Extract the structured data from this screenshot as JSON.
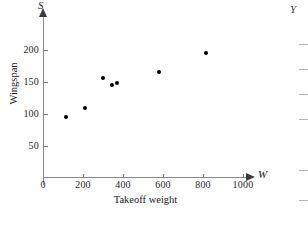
{
  "chart_data": {
    "type": "scatter",
    "title": "",
    "xlabel": "Takeoff weight",
    "ylabel": "Wingspan",
    "x_axis_variable": "W",
    "y_axis_variable": "S",
    "xlim": [
      0,
      1100
    ],
    "ylim": [
      0,
      225
    ],
    "grid": false,
    "legend": null,
    "x_ticks": [
      0,
      200,
      400,
      600,
      800,
      1000
    ],
    "y_ticks": [
      50,
      100,
      150,
      200
    ],
    "points": [
      {
        "x": 115,
        "y": 94
      },
      {
        "x": 210,
        "y": 108
      },
      {
        "x": 300,
        "y": 156
      },
      {
        "x": 345,
        "y": 145
      },
      {
        "x": 370,
        "y": 148
      },
      {
        "x": 580,
        "y": 165
      },
      {
        "x": 815,
        "y": 195
      }
    ]
  },
  "figure": {
    "x_tick_labels": [
      "0",
      "200",
      "400",
      "600",
      "800",
      "1000"
    ],
    "y_tick_labels": [
      "200",
      "150",
      "100",
      "50"
    ],
    "x_axis_variable": "W",
    "y_axis_variable": "S",
    "xlabel": "Takeoff weight",
    "ylabel": "Wingspan",
    "point_color": "#000000",
    "axis_color": "#8a8a8a"
  },
  "neighbor_figure": {
    "y_axis_variable": "Y"
  }
}
